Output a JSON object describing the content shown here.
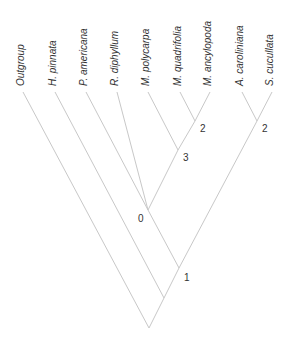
{
  "diagram": {
    "type": "cladogram",
    "colors": {
      "branch": "#c8c8c8",
      "text": "#333333",
      "background": "#ffffff"
    },
    "leaves": [
      {
        "id": "outgroup",
        "label": "Outgroup",
        "italic": false,
        "x": 23,
        "y": 92
      },
      {
        "id": "h_pinnata",
        "label": "H. pinnata",
        "italic": true,
        "x": 55,
        "y": 92
      },
      {
        "id": "p_americana",
        "label": "P. americana",
        "italic": true,
        "x": 86,
        "y": 92
      },
      {
        "id": "r_diphyllum",
        "label": "R. diphyllum",
        "italic": true,
        "x": 117,
        "y": 92
      },
      {
        "id": "m_polycarpa",
        "label": "M. polycarpa",
        "italic": true,
        "x": 148,
        "y": 92
      },
      {
        "id": "m_quadrifolia",
        "label": "M. quadrifolia",
        "italic": true,
        "x": 180,
        "y": 92
      },
      {
        "id": "m_ancylopoda",
        "label": "M. ancylopoda",
        "italic": true,
        "x": 210,
        "y": 92
      },
      {
        "id": "a_caroliniana",
        "label": "A. caroliniana",
        "italic": true,
        "x": 242,
        "y": 92
      },
      {
        "id": "s_cucullata",
        "label": "S. cucullata",
        "italic": true,
        "x": 272,
        "y": 92
      }
    ],
    "nodes": [
      {
        "id": "n_mq_ma",
        "label": "2",
        "x": 195,
        "y": 121,
        "lx": 200,
        "ly": 132
      },
      {
        "id": "n_a_s",
        "label": "2",
        "x": 257,
        "y": 121,
        "lx": 262,
        "ly": 132
      },
      {
        "id": "n_mp",
        "label": "3",
        "x": 178,
        "y": 150,
        "lx": 183,
        "ly": 161
      },
      {
        "id": "n_0",
        "label": "0",
        "x": 148,
        "y": 210,
        "lx": 138,
        "ly": 222
      },
      {
        "id": "n_1",
        "label": "1",
        "x": 179,
        "y": 268,
        "lx": 184,
        "ly": 281
      },
      {
        "id": "n_h",
        "label": "",
        "x": 164,
        "y": 298
      },
      {
        "id": "root",
        "label": "",
        "x": 149,
        "y": 328
      }
    ],
    "edges": [
      [
        "m_quadrifolia",
        "n_mq_ma"
      ],
      [
        "m_ancylopoda",
        "n_mq_ma"
      ],
      [
        "a_caroliniana",
        "n_a_s"
      ],
      [
        "s_cucullata",
        "n_a_s"
      ],
      [
        "m_polycarpa",
        "n_mp"
      ],
      [
        "n_mq_ma",
        "n_mp"
      ],
      [
        "n_mp",
        "n_0"
      ],
      [
        "r_diphyllum",
        "n_0"
      ],
      [
        "p_americana",
        "n_0"
      ],
      [
        "n_0",
        "n_1"
      ],
      [
        "n_a_s",
        "n_1"
      ],
      [
        "n_1",
        "n_h"
      ],
      [
        "h_pinnata",
        "n_h"
      ],
      [
        "n_h",
        "root"
      ],
      [
        "outgroup",
        "root"
      ]
    ]
  }
}
